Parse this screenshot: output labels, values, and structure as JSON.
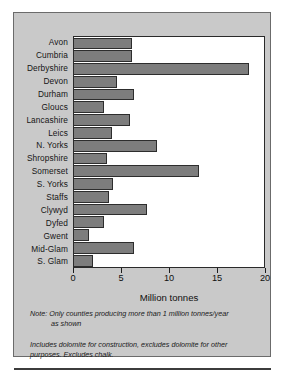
{
  "chart_data": {
    "type": "bar",
    "orientation": "horizontal",
    "title": "",
    "xlabel": "Million tonnes",
    "ylabel": "",
    "xlim": [
      0,
      20
    ],
    "xticks": [
      0,
      5,
      10,
      15,
      20
    ],
    "grid": false,
    "legend": null,
    "bar_color": "#7d7d7d",
    "bar_edge_color": "#2d2d2d",
    "categories": [
      "Avon",
      "Cumbria",
      "Derbyshire",
      "Devon",
      "Durham",
      "Gloucs",
      "Lancashire",
      "Leics",
      "N. Yorks",
      "Shropshire",
      "Somerset",
      "S. Yorks",
      "Staffs",
      "Clywyd",
      "Dyfed",
      "Gwent",
      "Mid-Glam",
      "S. Glam"
    ],
    "values": [
      6.1,
      6.1,
      18.4,
      4.5,
      6.3,
      3.2,
      5.9,
      4.0,
      8.7,
      3.5,
      13.2,
      4.1,
      3.7,
      7.7,
      3.2,
      1.6,
      6.3,
      2.0
    ],
    "annotations": [
      "Note:  Only counties producing more than 1 million tonnes/year as shown",
      "Includes dolomite for construction, excludes dolomite for other purposes. Excludes chalk."
    ]
  },
  "notes": {
    "note_label": "Note:",
    "note_line1": "Only counties producing more than 1 million tonnes/year",
    "note_line2": "as shown",
    "note2": "Includes dolomite for construction, excludes dolomite for other purposes. Excludes chalk."
  }
}
